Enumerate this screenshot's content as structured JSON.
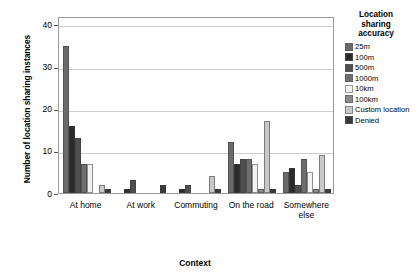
{
  "chart_data": {
    "type": "bar",
    "title": "",
    "xlabel": "Context",
    "ylabel": "Number of location sharing instances",
    "categories": [
      "At home",
      "At work",
      "Commuting",
      "On the road",
      "Somewhere else"
    ],
    "ylim": [
      0,
      42
    ],
    "yticks": [
      0,
      10,
      20,
      30,
      40
    ],
    "ytick_labels": [
      "0",
      "10",
      "20",
      "30",
      "40"
    ],
    "grid": true,
    "legend_position": "right",
    "legend_title": "Location sharing accuracy",
    "series": [
      {
        "name": "25m",
        "color": "#6b6b6b",
        "values": [
          35,
          0,
          0,
          12,
          5
        ]
      },
      {
        "name": "100m",
        "color": "#2b2b2b",
        "values": [
          16,
          1,
          1,
          7,
          6
        ]
      },
      {
        "name": "500m",
        "color": "#4f4f4f",
        "values": [
          13,
          3,
          2,
          8,
          2
        ]
      },
      {
        "name": "1000m",
        "color": "#6e6e6e",
        "values": [
          7,
          0,
          0,
          8,
          8
        ]
      },
      {
        "name": "10km",
        "color": "#f2f2f2",
        "values": [
          7,
          0,
          0,
          7,
          5
        ]
      },
      {
        "name": "100km",
        "color": "#8a8a8a",
        "values": [
          0,
          0,
          0,
          1,
          1
        ]
      },
      {
        "name": "Custom location",
        "color": "#c9c9c9",
        "values": [
          2,
          0,
          4,
          17,
          9
        ]
      },
      {
        "name": "Denied",
        "color": "#3a3a3a",
        "values": [
          1,
          2,
          1,
          1,
          1
        ]
      }
    ]
  },
  "legend": {
    "title_lines": [
      "Location",
      "sharing",
      "accuracy"
    ]
  }
}
